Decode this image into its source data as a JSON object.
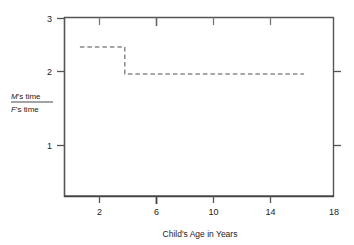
{
  "chart_data": {
    "type": "line",
    "title": "",
    "subtitle": "",
    "xlabel": "Child's Age in Years",
    "ylabel_numerator": "M's time",
    "ylabel_denominator": "F's time",
    "ylabel": "M's time / F's time",
    "grid": false,
    "legend": false,
    "legend_position": "none",
    "line_style": "dashed",
    "line_color": "#8a8a8a",
    "axis_color": "#555555",
    "background_color": "#ffffff",
    "xlim": [
      0,
      18
    ],
    "ylim": [
      0,
      3
    ],
    "xticks": [
      2,
      6,
      10,
      14,
      18
    ],
    "xtick_labels": [
      "2",
      "6",
      "10",
      "14",
      "18"
    ],
    "yticks": [
      1,
      2,
      3
    ],
    "ytick_labels": [
      "1",
      "2",
      "3"
    ],
    "series": [
      {
        "name": "M's time / F's time",
        "style": "step",
        "x": [
          1,
          4,
          4,
          16
        ],
        "values": [
          2.5,
          2.5,
          2.05,
          2.05
        ],
        "steps": [
          {
            "x_start": 1,
            "x_end": 4,
            "y": 2.5
          },
          {
            "x_start": 4,
            "x_end": 16,
            "y": 2.05
          }
        ]
      }
    ],
    "annotations": []
  }
}
